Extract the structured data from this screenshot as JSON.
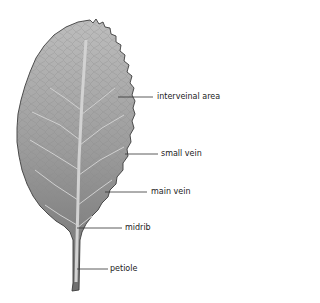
{
  "diagram": {
    "colors": {
      "leaf_top": "#b8b8b8",
      "leaf_bottom": "#707070",
      "outline": "#3a3a3a",
      "vein": "#d0d0d0",
      "leader": "#333333",
      "label_text": "#222222"
    },
    "labels": [
      {
        "id": "interveinal-area",
        "text": "interveinal area"
      },
      {
        "id": "small-vein",
        "text": "small vein"
      },
      {
        "id": "main-vein",
        "text": "main vein"
      },
      {
        "id": "midrib",
        "text": "midrib"
      },
      {
        "id": "petiole",
        "text": "petiole"
      }
    ]
  }
}
